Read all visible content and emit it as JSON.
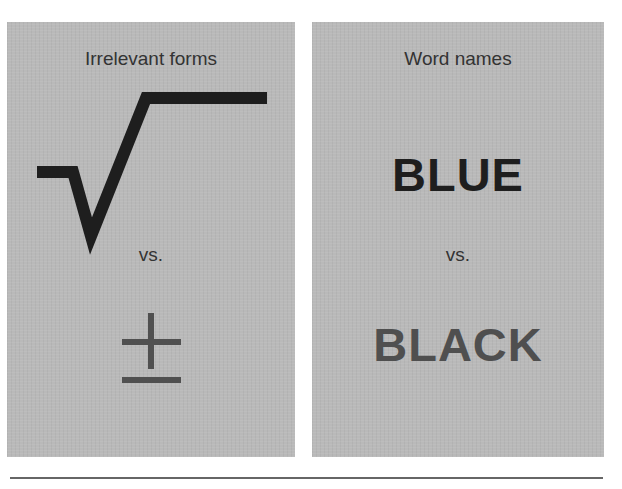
{
  "panels": {
    "left": {
      "title": "Irrelevant forms",
      "top_symbol": {
        "name": "square-root-symbol",
        "glyph": "√",
        "color": "#1e1e1e"
      },
      "separator": "vs.",
      "bottom_symbol": {
        "name": "plus-minus-symbol",
        "glyph": "±",
        "color": "#505050"
      }
    },
    "right": {
      "title": "Word names",
      "top_word": {
        "text": "BLUE",
        "color": "#1e1e1e"
      },
      "separator": "vs.",
      "bottom_word": {
        "text": "BLACK",
        "color": "#4f4f4f"
      }
    }
  },
  "colors": {
    "panel_background": "#b9b9b9",
    "page_background": "#ffffff",
    "rule": "#666666"
  }
}
